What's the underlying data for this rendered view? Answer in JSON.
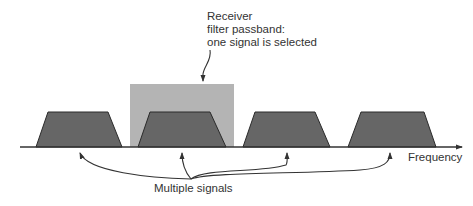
{
  "diagram": {
    "receiver_label": [
      "Receiver",
      "filter passband:",
      "one signal is selected"
    ],
    "axis_label": "Frequency",
    "signals_label": "Multiple signals",
    "colors": {
      "signal_fill": "#666666",
      "signal_stroke": "#2a2a2a",
      "passband_fill": "#b4b4b4",
      "axis": "#333333",
      "text": "#333333"
    },
    "signals": [
      {
        "name": "signal-1",
        "bottom": [
          36,
          122
        ],
        "top": [
          48,
          108
        ]
      },
      {
        "name": "signal-2",
        "bottom": [
          138,
          226
        ],
        "top": [
          150,
          210
        ],
        "selected": true
      },
      {
        "name": "signal-3",
        "bottom": [
          243,
          330
        ],
        "top": [
          255,
          315
        ]
      },
      {
        "name": "signal-4",
        "bottom": [
          348,
          436
        ],
        "top": [
          361,
          424
        ]
      }
    ],
    "passband": {
      "x": 130,
      "y": 84,
      "width": 104,
      "height": 63
    }
  }
}
